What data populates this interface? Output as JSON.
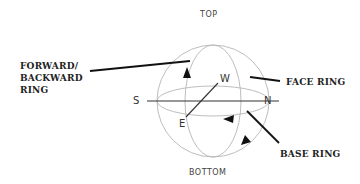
{
  "diagram": {
    "positions": {
      "top": "TOP",
      "bottom": "BOTTOM"
    },
    "directions": {
      "south": "S",
      "north": "N",
      "west": "W",
      "east": "E"
    },
    "callouts": {
      "forward_backward_ring": [
        "FORWARD/",
        "BACKWARD",
        "RING"
      ],
      "face_ring": "FACE RING",
      "base_ring": "BASE RING"
    },
    "colors": {
      "sphere_lines": "#b5b5b5",
      "axis_lines": "#333333",
      "leader_lines": "#111111",
      "text": "#222222"
    }
  }
}
